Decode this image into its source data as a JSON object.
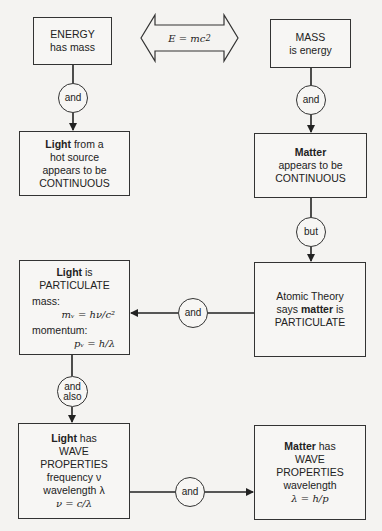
{
  "equation": {
    "text": "E = mc",
    "sup": "2"
  },
  "nodes": {
    "energy": {
      "l1": "ENERGY",
      "l2": "has mass"
    },
    "mass": {
      "l1": "MASS",
      "l2": "is energy"
    },
    "light_continuous": {
      "bold": "Light",
      "l1_rest": " from a",
      "l2": "hot source",
      "l3": "appears to be",
      "l4": "CONTINUOUS"
    },
    "matter_continuous": {
      "bold": "Matter",
      "l2": "appears to be",
      "l3": "CONTINUOUS"
    },
    "atomic": {
      "l1": "Atomic Theory",
      "l2_pre": "says ",
      "l2_bold": "matter",
      "l2_post": " is",
      "l3": "PARTICULATE"
    },
    "light_particulate": {
      "bold": "Light",
      "l1_rest": " is",
      "l2": "PARTICULATE",
      "mass_label": "mass:",
      "mass_eq": "mᵥ = hν/c²",
      "mom_label": "momentum:",
      "mom_eq": "pᵥ = h/λ"
    },
    "light_wave": {
      "bold": "Light",
      "l1_rest": " has",
      "l2": "WAVE",
      "l3": "PROPERTIES",
      "l4": "frequency ν",
      "l5": "wavelength λ",
      "l6": "ν = c/λ"
    },
    "matter_wave": {
      "bold": "Matter",
      "l1_rest": " has",
      "l2": "WAVE",
      "l3": "PROPERTIES",
      "l4": "wavelength",
      "l5": "λ = h/p"
    }
  },
  "connectors": {
    "c1": "and",
    "c2": "and",
    "c3": "but",
    "c4": "and",
    "c5_l1": "and",
    "c5_l2": "also",
    "c6": "and"
  }
}
